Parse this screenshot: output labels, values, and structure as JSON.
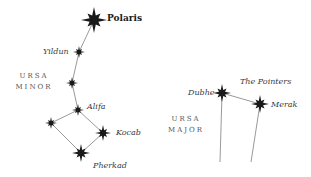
{
  "diagram": {
    "colors": {
      "star": "#1a1a1a",
      "line": "#9a9a9a",
      "label": "#3a3a3a",
      "constellation": "#555555"
    },
    "ursa_minor": {
      "name_line1": "URSA",
      "name_line2": "MINOR",
      "stars": [
        {
          "name": "Polaris",
          "x": 94,
          "y": 20,
          "size": "large"
        },
        {
          "name": "Yildun",
          "x": 79,
          "y": 52,
          "size": "small"
        },
        {
          "name": "",
          "x": 72,
          "y": 83,
          "size": "small"
        },
        {
          "name": "Alifa",
          "x": 78,
          "y": 110,
          "size": "small"
        },
        {
          "name": "",
          "x": 51,
          "y": 123,
          "size": "small"
        },
        {
          "name": "Kocab",
          "x": 103,
          "y": 133,
          "size": "medium"
        },
        {
          "name": "Pherkad",
          "x": 81,
          "y": 153,
          "size": "medium"
        }
      ]
    },
    "ursa_major": {
      "name_line1": "URSA",
      "name_line2": "MAJOR",
      "pointers_label": "The Pointers",
      "stars": [
        {
          "name": "Dubhe",
          "x": 222,
          "y": 93,
          "size": "medium"
        },
        {
          "name": "Merak",
          "x": 260,
          "y": 104,
          "size": "medium"
        }
      ]
    },
    "labels": {
      "polaris": "Polaris",
      "yildun": "Yildun",
      "alifa": "Alifa",
      "kocab": "Kocab",
      "pherkad": "Pherkad",
      "dubhe": "Dubhe",
      "merak": "Merak",
      "pointers": "The Pointers"
    }
  }
}
